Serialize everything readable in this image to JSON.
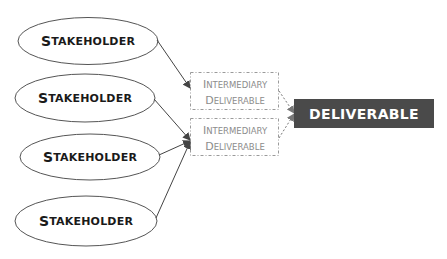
{
  "diagram": {
    "type": "flow",
    "colors": {
      "ellipse_stroke": "#555555",
      "arrow": "#444444",
      "dashed_border": "#9a9a9a",
      "intermediary_text": "#8c8c8c",
      "deliverable_fill": "#4a4a4a",
      "deliverable_text": "#ffffff"
    },
    "stakeholders": [
      {
        "cap": "S",
        "rest": "TAKEHOLDER",
        "label": "Stakeholder"
      },
      {
        "cap": "S",
        "rest": "TAKEHOLDER",
        "label": "Stakeholder"
      },
      {
        "cap": "S",
        "rest": "TAKEHOLDER",
        "label": "Stakeholder"
      },
      {
        "cap": "S",
        "rest": "TAKEHOLDER",
        "label": "Stakeholder"
      }
    ],
    "intermediaries": [
      {
        "line1_cap": "I",
        "line1_rest": "NTERMEDIARY",
        "line2_cap": "D",
        "line2_rest": "ELIVERABLE",
        "label": "Intermediary Deliverable"
      },
      {
        "line1_cap": "I",
        "line1_rest": "NTERMEDIARY",
        "line2_cap": "D",
        "line2_rest": "ELIVERABLE",
        "label": "Intermediary Deliverable"
      }
    ],
    "deliverable": {
      "label": "DELIVERABLE"
    },
    "edges": [
      {
        "from": "stakeholder-1",
        "to": "intermediary-1",
        "style": "solid"
      },
      {
        "from": "stakeholder-2",
        "to": "intermediary-2",
        "style": "solid"
      },
      {
        "from": "stakeholder-3",
        "to": "intermediary-2",
        "style": "solid"
      },
      {
        "from": "stakeholder-4",
        "to": "intermediary-2",
        "style": "solid"
      },
      {
        "from": "intermediary-1",
        "to": "deliverable",
        "style": "dashed"
      },
      {
        "from": "intermediary-2",
        "to": "deliverable",
        "style": "dashed"
      }
    ]
  }
}
